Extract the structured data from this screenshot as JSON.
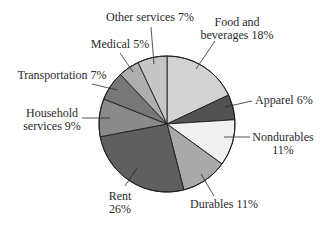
{
  "chart_data": {
    "type": "pie",
    "title": "",
    "start_angle_deg": 0,
    "direction": "clockwise",
    "center": [
      167,
      124
    ],
    "radius": 68,
    "slices": [
      {
        "label": "Food and beverages",
        "value": 18,
        "color": "#d2d2d2",
        "label_lines": [
          "Food and",
          "beverages 18%"
        ],
        "label_pos": [
          237,
          26
        ],
        "anchor": "middle",
        "leader": [
          [
            196,
            69
          ],
          [
            215,
            41
          ]
        ]
      },
      {
        "label": "Apparel",
        "value": 6,
        "color": "#525252",
        "label_lines": [
          "Apparel 6%"
        ],
        "label_pos": [
          255,
          104
        ],
        "anchor": "start",
        "leader": [
          [
            225,
            107
          ],
          [
            252,
            101
          ]
        ]
      },
      {
        "label": "Nondurables",
        "value": 11,
        "color": "#f1f1f1",
        "label_lines": [
          "Nondurables",
          "11%"
        ],
        "label_pos": [
          283,
          141
        ],
        "anchor": "middle",
        "leader": [
          [
            224,
            137
          ],
          [
            250,
            137
          ]
        ]
      },
      {
        "label": "Durables",
        "value": 11,
        "color": "#a9a9a9",
        "label_lines": [
          "Durables 11%"
        ],
        "label_pos": [
          224,
          208
        ],
        "anchor": "middle",
        "leader": [
          [
            201,
            174
          ],
          [
            214,
            196
          ]
        ]
      },
      {
        "label": "Rent",
        "value": 26,
        "color": "#5f5f5f",
        "label_lines": [
          "Rent",
          "26%"
        ],
        "label_pos": [
          120,
          200
        ],
        "anchor": "middle",
        "leader": [
          [
            137,
            168
          ],
          [
            125,
            186
          ]
        ]
      },
      {
        "label": "Household services",
        "value": 9,
        "color": "#8a8a8a",
        "label_lines": [
          "Household",
          "services 9%"
        ],
        "label_pos": [
          52,
          117
        ],
        "anchor": "middle",
        "leader": [
          [
            110,
            118
          ],
          [
            82,
            118
          ]
        ]
      },
      {
        "label": "Transportation",
        "value": 7,
        "color": "#777777",
        "label_lines": [
          "Transportation 7%"
        ],
        "label_pos": [
          62,
          79
        ],
        "anchor": "middle",
        "leader": [
          [
            117,
            90
          ],
          [
            92,
            84
          ]
        ]
      },
      {
        "label": "Medical",
        "value": 5,
        "color": "#aeaeae",
        "label_lines": [
          "Medical 5%"
        ],
        "label_pos": [
          120,
          48
        ],
        "anchor": "middle",
        "leader": [
          [
            133,
            72
          ],
          [
            120,
            53
          ]
        ]
      },
      {
        "label": "Other services",
        "value": 7,
        "color": "#c6c6c6",
        "label_lines": [
          "Other services 7%"
        ],
        "label_pos": [
          150,
          21
        ],
        "anchor": "middle",
        "leader": [
          [
            154,
            64
          ],
          [
            151,
            27
          ]
        ]
      }
    ],
    "legend": "none",
    "stroke_color": "#1e1e1e"
  }
}
